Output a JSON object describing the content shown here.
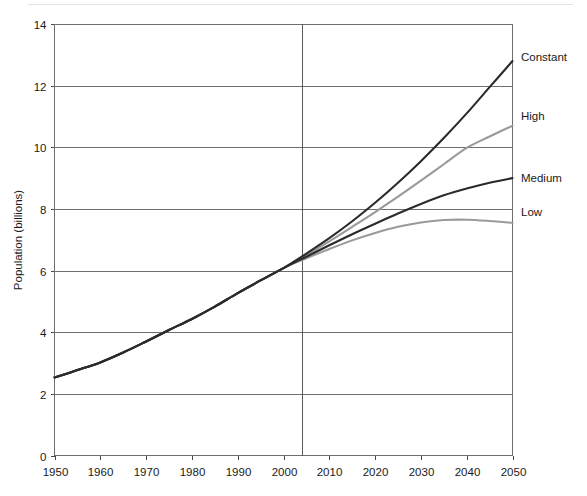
{
  "chart_data": {
    "type": "line",
    "title": "",
    "xlabel": "",
    "ylabel": "Population (billions)",
    "xlim": [
      1950,
      2050
    ],
    "ylim": [
      0,
      14
    ],
    "grid": true,
    "grid_axis": "y",
    "legend_position": "right-end-of-line",
    "xticks": [
      "1950",
      "1960",
      "1970",
      "1980",
      "1990",
      "2000",
      "2010",
      "2020",
      "2030",
      "2040",
      "2050"
    ],
    "yticks": [
      "0",
      "2",
      "4",
      "6",
      "8",
      "10",
      "12",
      "14"
    ],
    "annotations": [
      {
        "name": "projection-divider",
        "x": 2002,
        "note": "vertical line separating estimates from projections"
      }
    ],
    "series": [
      {
        "name": "Constant",
        "color": "#2b2b2b",
        "width": 2.1,
        "label_value": 12.8,
        "x": [
          1950,
          1955,
          1960,
          1965,
          1970,
          1975,
          1980,
          1985,
          1990,
          1995,
          2000,
          2005,
          2010,
          2015,
          2020,
          2025,
          2030,
          2035,
          2040,
          2045,
          2050
        ],
        "values": [
          2.53,
          2.77,
          3.02,
          3.34,
          3.7,
          4.07,
          4.43,
          4.83,
          5.27,
          5.68,
          6.08,
          6.55,
          7.05,
          7.6,
          8.2,
          8.85,
          9.55,
          10.3,
          11.1,
          11.95,
          12.8
        ]
      },
      {
        "name": "High",
        "color": "#9a9a9a",
        "width": 2.1,
        "label_value": 10.7,
        "x": [
          1950,
          1955,
          1960,
          1965,
          1970,
          1975,
          1980,
          1985,
          1990,
          1995,
          2000,
          2005,
          2010,
          2015,
          2020,
          2025,
          2030,
          2035,
          2040,
          2045,
          2050
        ],
        "values": [
          2.53,
          2.77,
          3.02,
          3.34,
          3.7,
          4.07,
          4.43,
          4.83,
          5.27,
          5.68,
          6.08,
          6.5,
          6.95,
          7.42,
          7.9,
          8.4,
          8.92,
          9.45,
          9.98,
          10.35,
          10.7
        ]
      },
      {
        "name": "Medium",
        "color": "#2b2b2b",
        "width": 2.1,
        "label_value": 9.0,
        "x": [
          1950,
          1955,
          1960,
          1965,
          1970,
          1975,
          1980,
          1985,
          1990,
          1995,
          2000,
          2005,
          2010,
          2015,
          2020,
          2025,
          2030,
          2035,
          2040,
          2045,
          2050
        ],
        "values": [
          2.53,
          2.77,
          3.02,
          3.34,
          3.7,
          4.07,
          4.43,
          4.83,
          5.27,
          5.68,
          6.08,
          6.45,
          6.82,
          7.18,
          7.52,
          7.85,
          8.16,
          8.44,
          8.66,
          8.85,
          9.0
        ]
      },
      {
        "name": "Low",
        "color": "#9a9a9a",
        "width": 2.1,
        "label_value": 7.55,
        "x": [
          1950,
          1955,
          1960,
          1965,
          1970,
          1975,
          1980,
          1985,
          1990,
          1995,
          2000,
          2005,
          2010,
          2015,
          2020,
          2025,
          2030,
          2035,
          2040,
          2045,
          2050
        ],
        "values": [
          2.53,
          2.77,
          3.02,
          3.34,
          3.7,
          4.07,
          4.43,
          4.83,
          5.27,
          5.68,
          6.08,
          6.4,
          6.7,
          6.98,
          7.22,
          7.42,
          7.56,
          7.64,
          7.65,
          7.61,
          7.55
        ]
      }
    ]
  }
}
